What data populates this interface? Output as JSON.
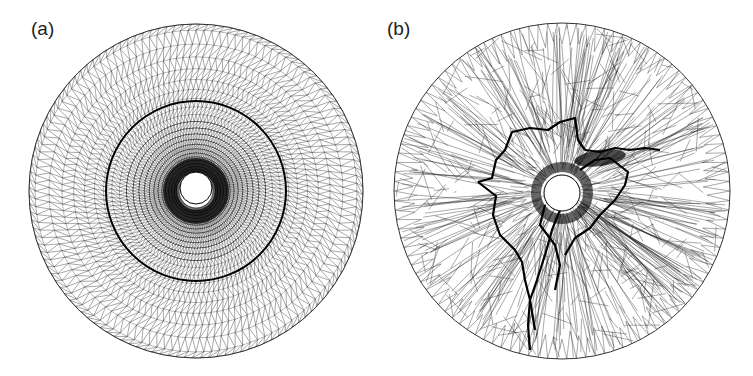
{
  "figure": {
    "panels": [
      {
        "id": "a",
        "label": "(a)",
        "description": "Structured concentric ring triangular mesh around a circular hole",
        "outer_circle": {
          "cx": 196,
          "cy": 191,
          "r": 167
        },
        "hole": {
          "cx": 196,
          "cy": 188,
          "r": 16
        },
        "mesh_type": "structured-rings",
        "highlight_ring_radius": 90
      },
      {
        "id": "b",
        "label": "(b)",
        "description": "Unstructured triangular mesh with radial spokes and dense crack-like network around a circular hole",
        "outer_circle": {
          "cx": 562,
          "cy": 191,
          "r": 168
        },
        "hole": {
          "cx": 562,
          "cy": 193,
          "r": 18
        },
        "mesh_type": "unstructured-radial"
      }
    ],
    "colors": {
      "line": "#1a1a1a",
      "background": "#ffffff"
    }
  }
}
